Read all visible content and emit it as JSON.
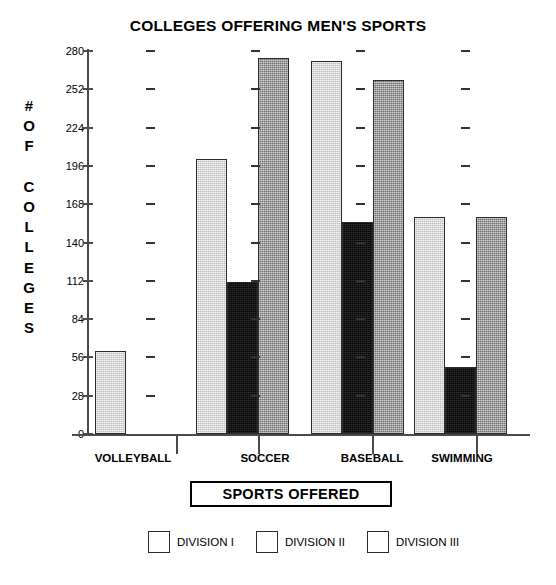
{
  "chart_data": {
    "type": "bar",
    "title": "COLLEGES OFFERING MEN'S SPORTS",
    "xlabel": "SPORTS OFFERED",
    "ylabel": "# OF COLLEGES",
    "ylabel_letters": [
      "#",
      "O",
      "F",
      "",
      "C",
      "O",
      "L",
      "L",
      "E",
      "G",
      "E",
      "S"
    ],
    "categories": [
      "VOLLEYBALL",
      "SOCCER",
      "BASEBALL",
      "SWIMMING"
    ],
    "yticks": [
      280,
      252,
      224,
      196,
      168,
      140,
      112,
      84,
      56,
      28,
      0
    ],
    "ylim": [
      0,
      280
    ],
    "grid": "dashes",
    "legend_position": "bottom",
    "series": [
      {
        "name": "DIVISION I",
        "color": "#d2d2d2",
        "values": [
          61,
          201,
          273,
          159
        ]
      },
      {
        "name": "DIVISION II",
        "color": "#0d0d0d",
        "values": [
          null,
          111,
          155,
          49
        ]
      },
      {
        "name": "DIVISION III",
        "color": "#a6a6a6",
        "values": [
          null,
          275,
          259,
          159
        ]
      }
    ]
  }
}
